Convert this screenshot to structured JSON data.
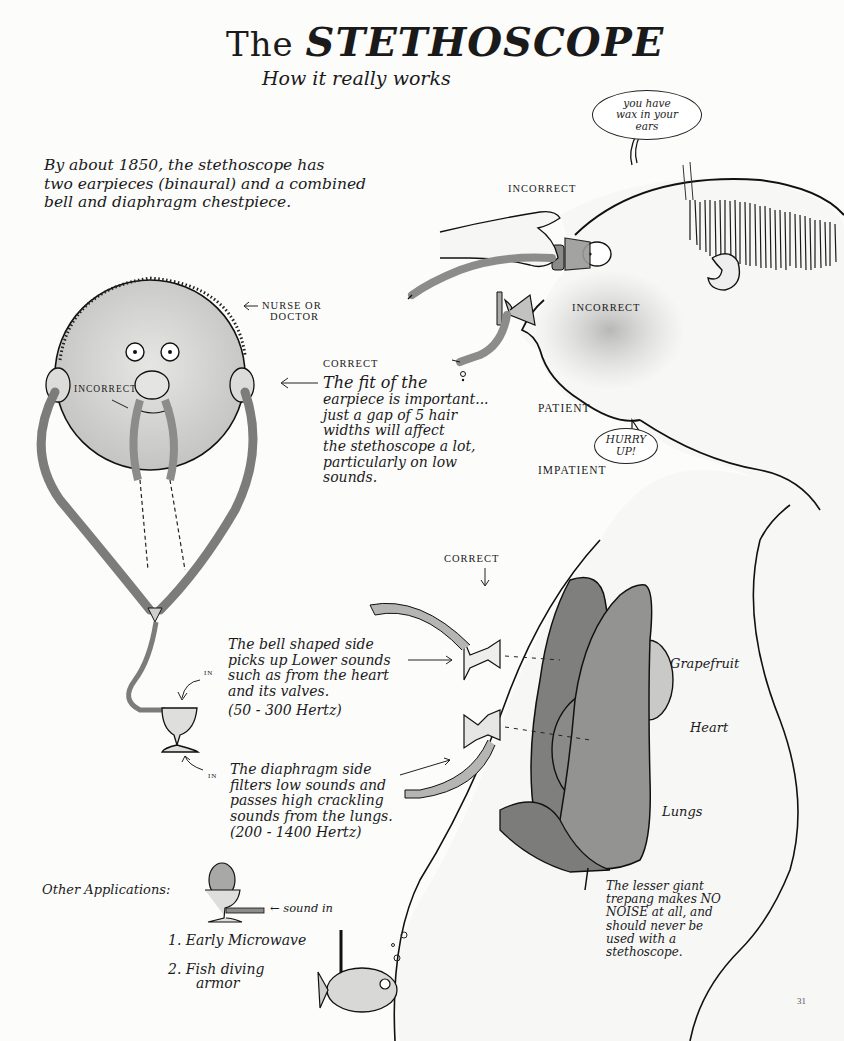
{
  "header": {
    "title_prefix": "The",
    "title_main": "STETHOSCOPE",
    "subtitle": "How it really works"
  },
  "intro": {
    "lines": [
      "By about 1850, the stethoscope has",
      "two earpieces (binaural) and a combined",
      "bell and diaphragm chestpiece."
    ]
  },
  "patient_head": {
    "speech_bubble": [
      "you have",
      "wax in your",
      "ears"
    ],
    "label_incorrect_eye": "INCORRECT",
    "label_incorrect_nose": "INCORRECT",
    "label_patient": "PATIENT",
    "label_impatient": "IMPATIENT",
    "hurry_bubble": [
      "HURRY",
      "UP!"
    ]
  },
  "doctor_head": {
    "label_role": [
      "NURSE or",
      "DOCTOR"
    ],
    "label_incorrect": "INCORRECT",
    "correct_heading": "CORRECT",
    "correct_note": [
      "The fit of the",
      "earpiece is important...",
      "just a gap of 5 hair",
      "widths will affect",
      "the stethoscope a lot,",
      "particularly on low",
      "sounds."
    ]
  },
  "chestpiece": {
    "label_correct": "CORRECT",
    "in_label_top": "IN",
    "in_label_bottom": "IN",
    "bell_note": [
      "The bell shaped side",
      "picks up Lower sounds",
      "such as from the heart",
      "and its valves.",
      "(50 - 300 Hertz)"
    ],
    "diaphragm_note": [
      "The diaphragm side",
      "filters low sounds and",
      "passes high crackling",
      "sounds from the lungs.",
      "(200 - 1400 Hertz)"
    ]
  },
  "organs": {
    "grapefruit": "Grapefruit",
    "heart": "Heart",
    "lungs": "Lungs",
    "trepang_note": [
      "The lesser giant",
      "trepang makes NO",
      "NOISE at all, and",
      "should never be",
      "used with a",
      "stethoscope."
    ]
  },
  "other_applications": {
    "heading": "Other Applications:",
    "sound_in": "← sound in",
    "items": [
      "1. Early Microwave",
      "2. Fish diving",
      "armor"
    ]
  },
  "page_number": "31",
  "colors": {
    "paper": "#fcfcfb",
    "ink": "#1a1a1a",
    "wash_light": "#d6d6d4",
    "wash_mid": "#9c9c9a",
    "wash_dark": "#7c7c7a"
  }
}
